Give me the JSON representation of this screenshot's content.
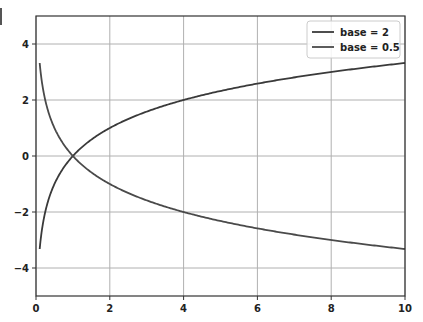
{
  "chart_data": {
    "type": "line",
    "title": "",
    "xlabel": "",
    "ylabel": "",
    "xlim": [
      0,
      10
    ],
    "ylim": [
      -5,
      5
    ],
    "grid": true,
    "legend_position": "upper right",
    "xticks": [
      0,
      2,
      4,
      6,
      8,
      10
    ],
    "yticks": [
      -4,
      -2,
      0,
      2,
      4
    ],
    "xtick_labels": [
      "0",
      "2",
      "4",
      "6",
      "8",
      "10"
    ],
    "ytick_labels": [
      "−4",
      "−2",
      "0",
      "2",
      "4"
    ],
    "x_start": 0.1,
    "x_end": 10,
    "series": [
      {
        "name": "base = 2",
        "function": "log2(x)",
        "color": "#3a3a3a",
        "x": [
          0.1,
          0.25,
          0.5,
          1,
          2,
          4,
          6,
          8,
          10
        ],
        "values": [
          -3.32,
          -2.0,
          -1.0,
          0.0,
          1.0,
          2.0,
          2.58,
          3.0,
          3.32
        ]
      },
      {
        "name": "base = 0.5",
        "function": "log0.5(x)",
        "color": "#4a4a4a",
        "x": [
          0.1,
          0.25,
          0.5,
          1,
          2,
          4,
          6,
          8,
          10
        ],
        "values": [
          3.32,
          2.0,
          1.0,
          0.0,
          -1.0,
          -2.0,
          -2.58,
          -3.0,
          -3.32
        ]
      }
    ]
  },
  "colors": {
    "axes": "#333333",
    "grid": "#b0b0b0",
    "legend_border": "#cccccc"
  }
}
